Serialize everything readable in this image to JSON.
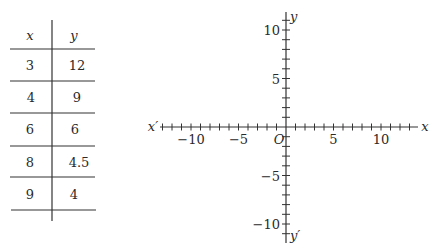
{
  "table": {
    "headers": [
      "x",
      "y"
    ],
    "rows": [
      {
        "x": "3",
        "y": "12"
      },
      {
        "x": "4",
        "y": "9"
      },
      {
        "x": "6",
        "y": "6"
      },
      {
        "x": "8",
        "y": "4.5"
      },
      {
        "x": "9",
        "y": "4"
      }
    ]
  },
  "graph": {
    "x_axis_label_pos": "x",
    "x_axis_label_neg": "x′",
    "y_axis_label_pos": "y",
    "y_axis_label_neg": "y′",
    "origin_label": "O",
    "x_tick_labels": [
      {
        "value": -10,
        "text": "−10"
      },
      {
        "value": -5,
        "text": "−5"
      },
      {
        "value": 5,
        "text": "5"
      },
      {
        "value": 10,
        "text": "10"
      }
    ],
    "y_tick_labels": [
      {
        "value": 10,
        "text": "10"
      },
      {
        "value": 5,
        "text": "5"
      },
      {
        "value": -5,
        "text": "−5"
      },
      {
        "value": -10,
        "text": "−10"
      }
    ],
    "x_range": [
      -13,
      13
    ],
    "y_range": [
      -12,
      12
    ],
    "tick_step": 1
  }
}
